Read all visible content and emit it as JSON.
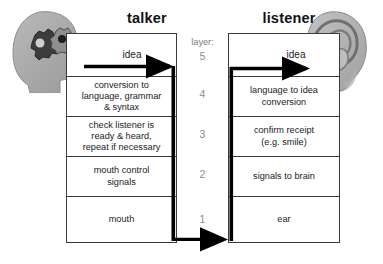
{
  "figure": {
    "type": "layered-communication-diagram",
    "background_color": "#ffffff",
    "line_color": "#3a3a3a",
    "accent_color": "#000000",
    "muted_text_color": "#8d8d8d"
  },
  "columns": {
    "talker_title": "talker",
    "listener_title": "listener"
  },
  "layer_axis": {
    "caption": "layer:",
    "numbers": [
      "5",
      "4",
      "3",
      "2",
      "1"
    ]
  },
  "arrows": {
    "talker_idea_label": "idea",
    "listener_idea_label": "idea"
  },
  "talker_cells": [
    {
      "layer": "5",
      "text": ""
    },
    {
      "layer": "4",
      "line1": "conversion to",
      "line2": "language, grammar",
      "line3": "& syntax"
    },
    {
      "layer": "3",
      "line1": "check listener is",
      "line2": "ready & heard,",
      "line3": "repeat if necessary"
    },
    {
      "layer": "2",
      "line1": "mouth control",
      "line2": "signals",
      "line3": ""
    },
    {
      "layer": "1",
      "line1": "mouth",
      "line2": "",
      "line3": ""
    }
  ],
  "listener_cells": [
    {
      "layer": "5",
      "text": ""
    },
    {
      "layer": "4",
      "line1": "language to idea",
      "line2": "conversion",
      "line3": ""
    },
    {
      "layer": "3",
      "line1": "confirm receipt",
      "line2": "(e.g. smile)",
      "line3": ""
    },
    {
      "layer": "2",
      "line1": "signals to brain",
      "line2": "",
      "line3": ""
    },
    {
      "layer": "1",
      "line1": "ear",
      "line2": "",
      "line3": ""
    }
  ],
  "illustrations": {
    "head": "head-with-gears-illustration",
    "ear": "ear-illustration"
  }
}
